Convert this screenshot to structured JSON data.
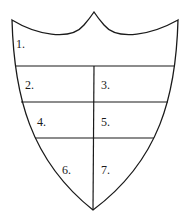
{
  "diagram": {
    "type": "shield-divisions",
    "stroke_color": "#1a1a1a",
    "background": "#ffffff",
    "sections": [
      {
        "id": 1,
        "label": "1."
      },
      {
        "id": 2,
        "label": "2."
      },
      {
        "id": 3,
        "label": "3."
      },
      {
        "id": 4,
        "label": "4."
      },
      {
        "id": 5,
        "label": "5."
      },
      {
        "id": 6,
        "label": "6."
      },
      {
        "id": 7,
        "label": "7."
      }
    ]
  }
}
